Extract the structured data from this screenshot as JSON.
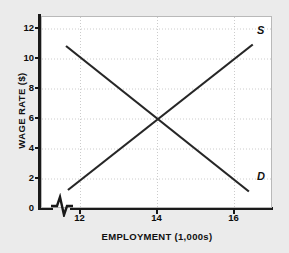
{
  "chart_data": {
    "type": "line",
    "title": "",
    "xlabel": "EMPLOYMENT (1,000s)",
    "ylabel": "WAGE RATE ($)",
    "xlim": [
      11.0,
      17.0
    ],
    "ylim": [
      0,
      12.8
    ],
    "xticks": [
      12,
      14,
      16
    ],
    "xtick_labels": [
      "12",
      "14",
      "16"
    ],
    "yticks": [
      0,
      2,
      4,
      6,
      8,
      10,
      12
    ],
    "ytick_labels": [
      "0",
      "2",
      "4",
      "6",
      "8",
      "10",
      "12"
    ],
    "grid": true,
    "grid_style": "dotted",
    "axis_break": true,
    "legend_position": "inline-curve-labels",
    "equilibrium": {
      "employment": 14,
      "wage": 6
    },
    "series": [
      {
        "name": "S",
        "label": "S",
        "role": "supply",
        "color": "#262626",
        "points": [
          {
            "x": 11.7,
            "y": 1.2
          },
          {
            "x": 16.5,
            "y": 10.9
          }
        ]
      },
      {
        "name": "D",
        "label": "D",
        "role": "demand",
        "color": "#262626",
        "points": [
          {
            "x": 11.65,
            "y": 10.8
          },
          {
            "x": 16.4,
            "y": 1.1
          }
        ]
      }
    ]
  },
  "colors": {
    "background": "#ebebeb",
    "plot_background": "#ffffff",
    "axis": "#1a1a1a",
    "curve": "#262626",
    "grid": "#cccccc"
  }
}
